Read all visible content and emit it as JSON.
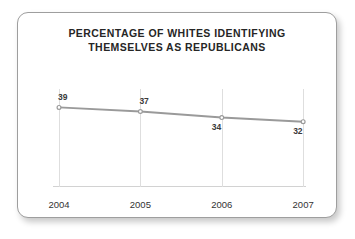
{
  "card": {
    "title_line1": "PERCENTAGE OF WHITES IDENTIFYING",
    "title_line2": "THEMSELVES AS REPUBLICANS"
  },
  "chart_data": {
    "type": "line",
    "title": "PERCENTAGE OF WHITES IDENTIFYING THEMSELVES AS REPUBLICANS",
    "xlabel": "",
    "ylabel": "",
    "categories": [
      "2004",
      "2005",
      "2006",
      "2007"
    ],
    "values": [
      39,
      37,
      34,
      32
    ],
    "point_labels": [
      "39",
      "37",
      "34",
      "32"
    ],
    "label_positions": [
      "above",
      "above",
      "below",
      "below"
    ],
    "ylim": [
      0,
      48
    ],
    "grid": "vertical",
    "legend": "none",
    "line_color": "#9a9a9a",
    "marker_color": "#9a9a9a",
    "gridline_color": "#dedede",
    "axis_color": "#d2d2d2",
    "title_color": "#262626",
    "label_color": "#3a3a3a"
  }
}
